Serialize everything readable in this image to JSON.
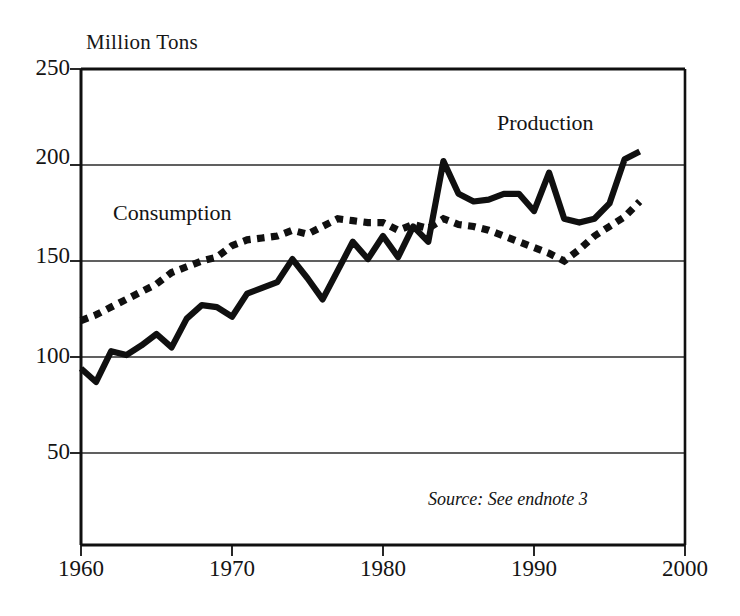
{
  "chart_data": {
    "type": "line",
    "title": "",
    "ylabel": "Million Tons",
    "xlabel": "",
    "xlim": [
      1960,
      2000
    ],
    "ylim": [
      0,
      250
    ],
    "yticks": [
      50,
      100,
      150,
      200,
      250
    ],
    "xticks": [
      1960,
      1970,
      1980,
      1990,
      2000
    ],
    "grid": true,
    "legend_position": "inline-annotations",
    "annotations": [
      {
        "text": "Consumption",
        "x": 1963.5,
        "y": 180
      },
      {
        "text": "Production",
        "x": 1989.0,
        "y": 218
      },
      {
        "text": "Source: See endnote 3",
        "x": 1992.0,
        "y": 18
      }
    ],
    "x": [
      1960,
      1961,
      1962,
      1963,
      1964,
      1965,
      1966,
      1967,
      1968,
      1969,
      1970,
      1971,
      1972,
      1973,
      1974,
      1975,
      1976,
      1977,
      1978,
      1979,
      1980,
      1981,
      1982,
      1983,
      1984,
      1985,
      1986,
      1987,
      1988,
      1989,
      1990,
      1991,
      1992,
      1993,
      1994,
      1995,
      1996,
      1997
    ],
    "series": [
      {
        "name": "Production",
        "style": "solid",
        "color": "#101010",
        "values": [
          94,
          87,
          103,
          101,
          106,
          112,
          105,
          120,
          127,
          126,
          121,
          133,
          136,
          139,
          151,
          141,
          130,
          145,
          160,
          151,
          163,
          152,
          168,
          160,
          202,
          185,
          181,
          182,
          185,
          185,
          176,
          196,
          172,
          170,
          172,
          180,
          203,
          207
        ]
      },
      {
        "name": "Consumption",
        "style": "dotted",
        "color": "#101010",
        "values": [
          119,
          122,
          126,
          130,
          134,
          138,
          144,
          147,
          150,
          152,
          158,
          161,
          162,
          163,
          166,
          164,
          168,
          172,
          171,
          170,
          170,
          166,
          169,
          167,
          172,
          169,
          168,
          166,
          163,
          160,
          157,
          154,
          150,
          156,
          163,
          168,
          173,
          181
        ]
      }
    ]
  },
  "labels": {
    "y_axis_title": "Million Tons",
    "y_ticks": [
      "250",
      "200",
      "150",
      "100",
      "50"
    ],
    "x_ticks": [
      "1960",
      "1970",
      "1980",
      "1990",
      "2000"
    ],
    "production": "Production",
    "consumption": "Consumption",
    "source": "Source: See endnote 3"
  },
  "colors": {
    "line": "#101010",
    "grid": "#2b2b2b",
    "axis": "#101010",
    "background": "#ffffff"
  }
}
